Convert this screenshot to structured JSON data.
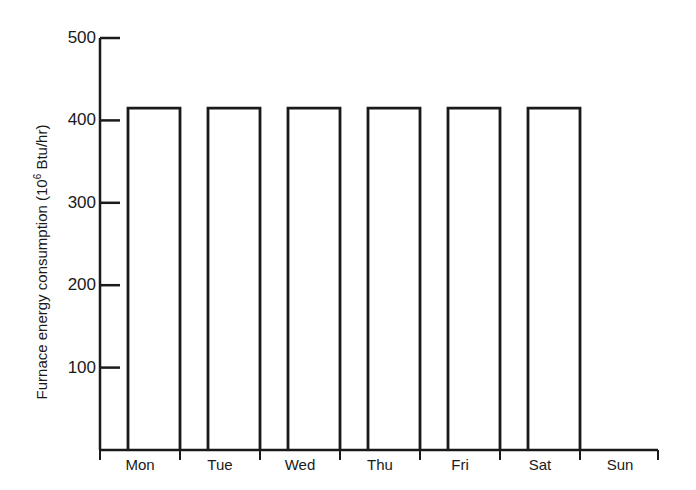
{
  "chart_data": {
    "type": "bar",
    "title": "",
    "xlabel": "",
    "ylabel": "Furnace energy consumption (10^6 Btu/hr)",
    "ylabel_parts": {
      "prefix": "Furnace energy consumption (10",
      "sup": "6",
      "suffix": " Btu/hr)"
    },
    "categories": [
      "Mon",
      "Tue",
      "Wed",
      "Thu",
      "Fri",
      "Sat",
      "Sun"
    ],
    "values": [
      415,
      415,
      415,
      415,
      415,
      415,
      0
    ],
    "yticks": [
      100,
      200,
      300,
      400,
      500
    ],
    "ylim": [
      0,
      500
    ],
    "grid": false,
    "legend": null,
    "bar_style": "outline"
  }
}
